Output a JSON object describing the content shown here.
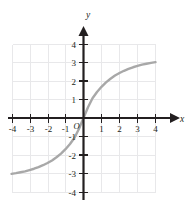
{
  "chart_data": {
    "type": "line",
    "title": "",
    "subtitle": "",
    "xlabel": "x",
    "ylabel": "y",
    "xlim": [
      -4,
      4
    ],
    "ylim": [
      -4,
      4
    ],
    "grid": true,
    "legend": null,
    "origin_label": "O",
    "xticks": [
      -4,
      -3,
      -2,
      -1,
      1,
      2,
      3,
      4
    ],
    "yticks": [
      -4,
      -3,
      -2,
      -1,
      1,
      2,
      3,
      4
    ],
    "xtick_labels": [
      "-4",
      "-3",
      "-2",
      "-1",
      "1",
      "2",
      "3",
      "4"
    ],
    "ytick_labels": [
      "-4",
      "-3",
      "-2",
      "-1",
      "1",
      "2",
      "3",
      "4"
    ],
    "series": [
      {
        "name": "curve",
        "color": "#a8a8a8",
        "x": [
          -4.0,
          -3.75,
          -3.5,
          -3.25,
          -3.0,
          -2.75,
          -2.5,
          -2.25,
          -2.0,
          -1.75,
          -1.5,
          -1.25,
          -1.0,
          -0.75,
          -0.5,
          -0.25,
          0.0,
          0.25,
          0.5,
          0.75,
          1.0,
          1.25,
          1.5,
          1.75,
          2.0,
          2.25,
          2.5,
          2.75,
          3.0,
          3.25,
          3.5,
          3.75,
          4.0
        ],
        "y": [
          -3.03,
          -2.99,
          -2.94,
          -2.89,
          -2.82,
          -2.75,
          -2.66,
          -2.56,
          -2.44,
          -2.3,
          -2.13,
          -1.93,
          -1.69,
          -1.41,
          -1.07,
          -0.58,
          0.0,
          0.58,
          1.07,
          1.41,
          1.69,
          1.93,
          2.13,
          2.3,
          2.44,
          2.56,
          2.66,
          2.75,
          2.82,
          2.89,
          2.94,
          2.99,
          3.03
        ]
      }
    ]
  },
  "style": {
    "grid_color": "#e8e8ea",
    "axis_color": "#231f20",
    "curve_color": "#a8a8a8",
    "background": "#ffffff"
  }
}
